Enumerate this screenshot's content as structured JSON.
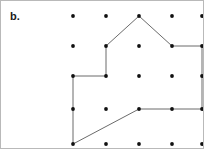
{
  "figure": {
    "label": "b.",
    "label_x": 9,
    "label_y": 9,
    "width": 204,
    "height": 149,
    "background_color": "#ffffff",
    "border_color": "#b9b9b9",
    "dot_color": "#111111",
    "polygon_stroke_color": "#6b6b6b",
    "polygon_fill": "none",
    "polygon_stroke_width": 1,
    "dot_radius": 1.9
  },
  "grid": {
    "columns": 5,
    "rows": 5,
    "column_x": [
      72,
      105,
      138,
      171,
      201
    ],
    "row_y": [
      15,
      45,
      75,
      108,
      143
    ],
    "spacing_x": 33,
    "spacing_y": 31,
    "dots": [
      {
        "col": 0,
        "row": 0,
        "x": 72,
        "y": 15
      },
      {
        "col": 1,
        "row": 0,
        "x": 105,
        "y": 15
      },
      {
        "col": 2,
        "row": 0,
        "x": 138,
        "y": 15
      },
      {
        "col": 3,
        "row": 0,
        "x": 171,
        "y": 15
      },
      {
        "col": 4,
        "row": 0,
        "x": 201,
        "y": 15
      },
      {
        "col": 0,
        "row": 1,
        "x": 72,
        "y": 45
      },
      {
        "col": 1,
        "row": 1,
        "x": 105,
        "y": 45
      },
      {
        "col": 2,
        "row": 1,
        "x": 138,
        "y": 45
      },
      {
        "col": 3,
        "row": 1,
        "x": 171,
        "y": 45
      },
      {
        "col": 4,
        "row": 1,
        "x": 201,
        "y": 45
      },
      {
        "col": 0,
        "row": 2,
        "x": 72,
        "y": 75
      },
      {
        "col": 1,
        "row": 2,
        "x": 105,
        "y": 75
      },
      {
        "col": 2,
        "row": 2,
        "x": 138,
        "y": 75
      },
      {
        "col": 3,
        "row": 2,
        "x": 171,
        "y": 75
      },
      {
        "col": 4,
        "row": 2,
        "x": 201,
        "y": 75
      },
      {
        "col": 0,
        "row": 3,
        "x": 72,
        "y": 108
      },
      {
        "col": 1,
        "row": 3,
        "x": 105,
        "y": 108
      },
      {
        "col": 2,
        "row": 3,
        "x": 138,
        "y": 108
      },
      {
        "col": 3,
        "row": 3,
        "x": 171,
        "y": 108
      },
      {
        "col": 4,
        "row": 3,
        "x": 201,
        "y": 108
      },
      {
        "col": 0,
        "row": 4,
        "x": 72,
        "y": 143
      },
      {
        "col": 1,
        "row": 4,
        "x": 105,
        "y": 143
      },
      {
        "col": 2,
        "row": 4,
        "x": 138,
        "y": 143
      },
      {
        "col": 3,
        "row": 4,
        "x": 171,
        "y": 143
      },
      {
        "col": 4,
        "row": 4,
        "x": 201,
        "y": 143
      }
    ]
  },
  "polygon": {
    "name": "house-shaped-polygon",
    "closed": true,
    "vertex_count": 9,
    "vertices": [
      {
        "x": 105,
        "y": 45,
        "grid_col": 1,
        "grid_row": 1
      },
      {
        "x": 138,
        "y": 15,
        "grid_col": 2,
        "grid_row": 0
      },
      {
        "x": 171,
        "y": 45,
        "grid_col": 3,
        "grid_row": 1
      },
      {
        "x": 201,
        "y": 45,
        "grid_col": 4,
        "grid_row": 1
      },
      {
        "x": 201,
        "y": 108,
        "grid_col": 4,
        "grid_row": 3
      },
      {
        "x": 138,
        "y": 108,
        "grid_col": 2,
        "grid_row": 3
      },
      {
        "x": 72,
        "y": 143,
        "grid_col": 0,
        "grid_row": 4
      },
      {
        "x": 72,
        "y": 75,
        "grid_col": 0,
        "grid_row": 2
      },
      {
        "x": 105,
        "y": 75,
        "grid_col": 1,
        "grid_row": 2
      }
    ],
    "points_attr": "105,45 138,15 171,45 201,45 201,108 138,108 72,143 72,75 105,75"
  }
}
